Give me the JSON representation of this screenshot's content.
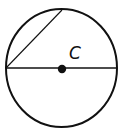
{
  "diagram": {
    "type": "circle-with-diameter-and-chord",
    "center_label": "C",
    "colors": {
      "stroke": "#111111",
      "background": "#ffffff"
    },
    "circle": {
      "cx": 61.5,
      "cy": 68,
      "rx": 55.5,
      "ry": 59
    },
    "diameter": {
      "x1": 6,
      "y1": 68,
      "x2": 117,
      "y2": 68
    },
    "chord": {
      "x1": 6,
      "y1": 68,
      "x2": 62,
      "y2": 10
    },
    "center_point": {
      "cx": 62,
      "cy": 69,
      "r": 4
    }
  }
}
